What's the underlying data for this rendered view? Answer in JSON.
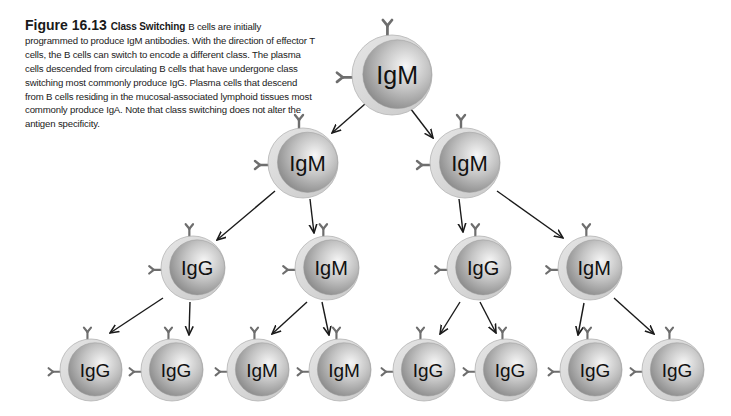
{
  "caption": {
    "figure_number": "Figure 16.13",
    "title": "Class Switching",
    "text": "B cells are initially programmed to produce IgM antibodies. With the direction of effector T cells, the B cells can switch to encode a different class. The plasma cells descended from circulating B cells that have undergone class switching most commonly produce IgG. Plasma cells that descend from B cells residing in the mucosal-associated lymphoid tissues most commonly produce IgA. Note that class switching does not alter the antigen specificity."
  },
  "colors": {
    "cell_outer": "#dcdcdc",
    "cell_inner_light": "#f4f4f4",
    "cell_inner_dark": "#8a8a8a",
    "antibody": "#6e6e6e",
    "arrow": "#1a1a1a",
    "label": "#111111"
  },
  "cells": [
    {
      "id": "c0",
      "label": "IgM",
      "cx": 392,
      "cy": 75,
      "r": 40,
      "row": 1
    },
    {
      "id": "c1",
      "label": "IgM",
      "cx": 303,
      "cy": 163,
      "r": 35,
      "row": 2
    },
    {
      "id": "c2",
      "label": "IgM",
      "cx": 465,
      "cy": 163,
      "r": 35,
      "row": 2
    },
    {
      "id": "c3",
      "label": "IgG",
      "cx": 193,
      "cy": 268,
      "r": 32,
      "row": 3
    },
    {
      "id": "c4",
      "label": "IgM",
      "cx": 327,
      "cy": 268,
      "r": 32,
      "row": 3
    },
    {
      "id": "c5",
      "label": "IgG",
      "cx": 479,
      "cy": 268,
      "r": 32,
      "row": 3
    },
    {
      "id": "c6",
      "label": "IgM",
      "cx": 590,
      "cy": 268,
      "r": 32,
      "row": 3
    },
    {
      "id": "c7",
      "label": "IgG",
      "cx": 91,
      "cy": 370,
      "r": 31,
      "row": 4
    },
    {
      "id": "c8",
      "label": "IgG",
      "cx": 172,
      "cy": 370,
      "r": 31,
      "row": 4
    },
    {
      "id": "c9",
      "label": "IgM",
      "cx": 258,
      "cy": 370,
      "r": 31,
      "row": 4
    },
    {
      "id": "c10",
      "label": "IgM",
      "cx": 340,
      "cy": 370,
      "r": 31,
      "row": 4
    },
    {
      "id": "c11",
      "label": "IgG",
      "cx": 424,
      "cy": 370,
      "r": 31,
      "row": 4
    },
    {
      "id": "c12",
      "label": "IgG",
      "cx": 506,
      "cy": 370,
      "r": 31,
      "row": 4
    },
    {
      "id": "c13",
      "label": "IgG",
      "cx": 591,
      "cy": 370,
      "r": 31,
      "row": 4
    },
    {
      "id": "c14",
      "label": "IgG",
      "cx": 673,
      "cy": 370,
      "r": 31,
      "row": 4
    }
  ],
  "arrows": [
    {
      "from": "c0",
      "to": "c1",
      "x1": 365,
      "y1": 104,
      "x2": 332,
      "y2": 133
    },
    {
      "from": "c0",
      "to": "c2",
      "x1": 407,
      "y1": 104,
      "x2": 433,
      "y2": 138
    },
    {
      "from": "c1",
      "to": "c3",
      "x1": 275,
      "y1": 191,
      "x2": 217,
      "y2": 240
    },
    {
      "from": "c1",
      "to": "c4",
      "x1": 310,
      "y1": 199,
      "x2": 314,
      "y2": 233
    },
    {
      "from": "c2",
      "to": "c5",
      "x1": 459,
      "y1": 199,
      "x2": 463,
      "y2": 232
    },
    {
      "from": "c2",
      "to": "c6",
      "x1": 497,
      "y1": 191,
      "x2": 563,
      "y2": 238
    },
    {
      "from": "c3",
      "to": "c7",
      "x1": 163,
      "y1": 298,
      "x2": 110,
      "y2": 333
    },
    {
      "from": "c3",
      "to": "c8",
      "x1": 190,
      "y1": 302,
      "x2": 189,
      "y2": 335
    },
    {
      "from": "c4",
      "to": "c9",
      "x1": 307,
      "y1": 302,
      "x2": 272,
      "y2": 334
    },
    {
      "from": "c4",
      "to": "c10",
      "x1": 322,
      "y1": 302,
      "x2": 329,
      "y2": 335
    },
    {
      "from": "c5",
      "to": "c11",
      "x1": 460,
      "y1": 302,
      "x2": 440,
      "y2": 334
    },
    {
      "from": "c5",
      "to": "c12",
      "x1": 480,
      "y1": 302,
      "x2": 496,
      "y2": 333
    },
    {
      "from": "c6",
      "to": "c13",
      "x1": 584,
      "y1": 303,
      "x2": 578,
      "y2": 335
    },
    {
      "from": "c6",
      "to": "c14",
      "x1": 614,
      "y1": 298,
      "x2": 654,
      "y2": 334
    }
  ]
}
